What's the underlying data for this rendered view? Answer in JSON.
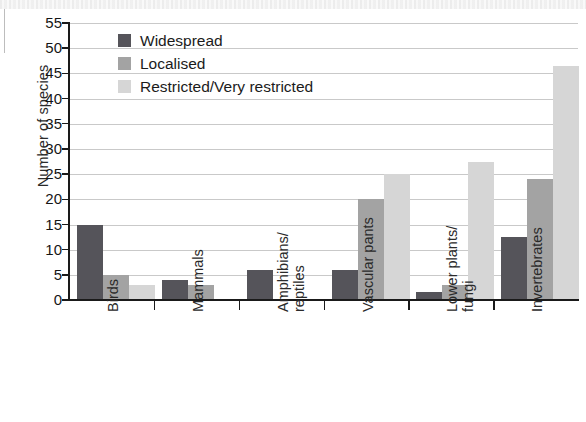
{
  "chart_data": {
    "type": "bar",
    "title": "",
    "xlabel": "",
    "ylabel": "Number of species",
    "ylim": [
      0,
      55
    ],
    "ytick_step": 5,
    "yticks": [
      0,
      5,
      10,
      15,
      20,
      25,
      30,
      35,
      40,
      45,
      50,
      55
    ],
    "grid": true,
    "legend_position": "top-left inside plot",
    "categories": [
      "Birds",
      "Mammals",
      "Amphibians/\nreptiles",
      "Vascular pants",
      "Lower plants/\nfungi",
      "Invertebrates"
    ],
    "series": [
      {
        "name": "Widespread",
        "color": "#55545a",
        "values": [
          15,
          4,
          6,
          6,
          1.5,
          12.5
        ]
      },
      {
        "name": "Localised",
        "color": "#a3a3a3",
        "values": [
          5,
          3,
          0,
          20,
          3,
          24
        ]
      },
      {
        "name": "Restricted/Very restricted",
        "color": "#d6d6d6",
        "values": [
          3,
          0,
          0,
          25,
          27.5,
          46.5
        ]
      }
    ]
  },
  "legend": {
    "items": [
      {
        "label": "Widespread",
        "color": "#55545a"
      },
      {
        "label": "Localised",
        "color": "#a3a3a3"
      },
      {
        "label": "Restricted/Very restricted",
        "color": "#d6d6d6"
      }
    ]
  },
  "axes": {
    "y_title": "Number of species"
  }
}
